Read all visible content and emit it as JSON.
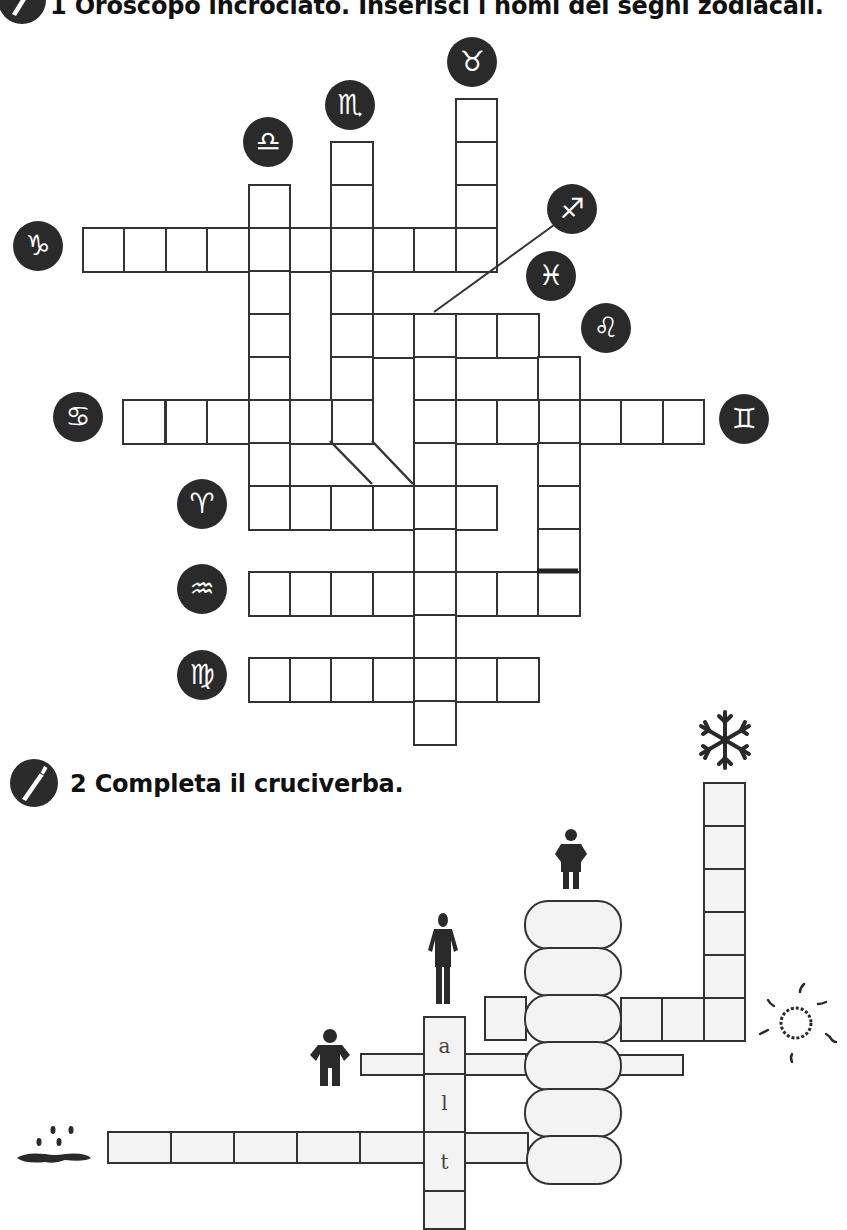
{
  "exercise1": {
    "number": "1",
    "title": "1 Oroscopo incrociato. Inserisci i nomi dei segni zodiacali.",
    "icon": "pen-icon",
    "grid": {
      "origin_x": 82,
      "origin_y": 98,
      "cell_w": 41.4,
      "cell_h": 43,
      "cells": [
        [
          9,
          0
        ],
        [
          6,
          1
        ],
        [
          9,
          1
        ],
        [
          4,
          2
        ],
        [
          6,
          2
        ],
        [
          9,
          2
        ],
        [
          0,
          3
        ],
        [
          1,
          3
        ],
        [
          2,
          3
        ],
        [
          3,
          3
        ],
        [
          4,
          3
        ],
        [
          5,
          3
        ],
        [
          6,
          3
        ],
        [
          7,
          3
        ],
        [
          8,
          3
        ],
        [
          9,
          3
        ],
        [
          4,
          4
        ],
        [
          6,
          4
        ],
        [
          4,
          5
        ],
        [
          6,
          5
        ],
        [
          7,
          5
        ],
        [
          8,
          5
        ],
        [
          9,
          5
        ],
        [
          10,
          5
        ],
        [
          4,
          6
        ],
        [
          6,
          6
        ],
        [
          8,
          6
        ],
        [
          11,
          6
        ],
        [
          4,
          7
        ],
        [
          6,
          7
        ],
        [
          8,
          7
        ],
        [
          11,
          7
        ],
        [
          1,
          7
        ],
        [
          2,
          7
        ],
        [
          3,
          7
        ],
        [
          5,
          7
        ],
        [
          9,
          7
        ],
        [
          10,
          7
        ],
        [
          12,
          7
        ],
        [
          13,
          7
        ],
        [
          14,
          7
        ],
        [
          0.96,
          7
        ],
        [
          4,
          8
        ],
        [
          8,
          8
        ],
        [
          11,
          8
        ],
        [
          4,
          9
        ],
        [
          5,
          9
        ],
        [
          6,
          9
        ],
        [
          7,
          9
        ],
        [
          8,
          9
        ],
        [
          9,
          9
        ],
        [
          11,
          9
        ],
        [
          8,
          10
        ],
        [
          11,
          10
        ],
        [
          4,
          11
        ],
        [
          5,
          11
        ],
        [
          6,
          11
        ],
        [
          7,
          11
        ],
        [
          8,
          11
        ],
        [
          9,
          11
        ],
        [
          10,
          11
        ],
        [
          11,
          11
        ],
        [
          8,
          12
        ],
        [
          4,
          13
        ],
        [
          5,
          13
        ],
        [
          6,
          13
        ],
        [
          7,
          13
        ],
        [
          8,
          13
        ],
        [
          9,
          13
        ],
        [
          10,
          13
        ],
        [
          8,
          14
        ]
      ]
    },
    "signs": [
      {
        "name": "toro",
        "glyph": "♉",
        "x": 447,
        "y": 37
      },
      {
        "name": "scorpione",
        "glyph": "♏",
        "x": 325,
        "y": 80
      },
      {
        "name": "bilancia",
        "glyph": "♎",
        "x": 243,
        "y": 117
      },
      {
        "name": "capricorno",
        "glyph": "♑",
        "x": 13,
        "y": 221
      },
      {
        "name": "sagittario",
        "glyph": "♐",
        "x": 547,
        "y": 184
      },
      {
        "name": "pesci",
        "glyph": "♓",
        "x": 526,
        "y": 251
      },
      {
        "name": "leone",
        "glyph": "♌",
        "x": 581,
        "y": 303
      },
      {
        "name": "cancro",
        "glyph": "♋",
        "x": 53,
        "y": 392
      },
      {
        "name": "gemelli",
        "glyph": "♊",
        "x": 719,
        "y": 394
      },
      {
        "name": "ariete",
        "glyph": "♈",
        "x": 177,
        "y": 479
      },
      {
        "name": "acquario",
        "glyph": "♒",
        "x": 177,
        "y": 564
      },
      {
        "name": "vergine",
        "glyph": "♍",
        "x": 177,
        "y": 650
      }
    ]
  },
  "exercise2": {
    "number": "2",
    "title": "2 Completa il cruciverba.",
    "icon": "pen-icon",
    "letters": [
      "a",
      "l",
      "t",
      ""
    ],
    "clues": [
      {
        "name": "snowflake-icon",
        "x": 698,
        "y": 710
      },
      {
        "name": "fat-person-icon",
        "x": 553,
        "y": 828
      },
      {
        "name": "tall-person-icon",
        "x": 424,
        "y": 912
      },
      {
        "name": "short-person-icon",
        "x": 308,
        "y": 1030
      },
      {
        "name": "sun-icon",
        "x": 755,
        "y": 985
      },
      {
        "name": "rain-puddle-icon",
        "x": 15,
        "y": 1125
      }
    ]
  }
}
